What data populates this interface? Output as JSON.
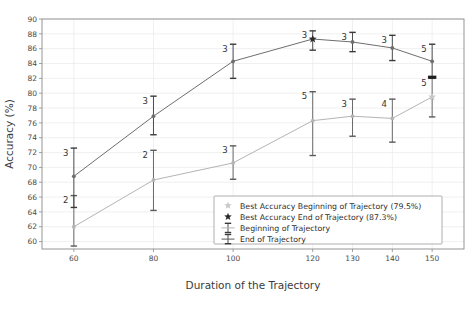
{
  "chart_data": {
    "type": "line",
    "title": "",
    "xlabel": "Duration of the Trajectory",
    "ylabel": "Accuracy (%)",
    "x": [
      60,
      80,
      100,
      120,
      130,
      140,
      150
    ],
    "xtick_labels": [
      "60",
      "80",
      "100",
      "120",
      "130",
      "140",
      "150"
    ],
    "ytick_labels": [
      "60",
      "62",
      "64",
      "66",
      "68",
      "70",
      "72",
      "74",
      "76",
      "78",
      "80",
      "82",
      "84",
      "86",
      "88",
      "90"
    ],
    "ylim": [
      59,
      90
    ],
    "xlim": [
      52,
      158
    ],
    "grid": true,
    "legend_position": "lower right",
    "series": [
      {
        "name": "Beginning of Trajectory",
        "color": "#b4b4b4",
        "values": [
          62.0,
          68.3,
          70.6,
          76.3,
          76.9,
          76.6,
          79.5
        ],
        "err_low": [
          59.4,
          64.2,
          68.4,
          71.6,
          74.2,
          73.4,
          76.8
        ],
        "err_high": [
          66.2,
          72.3,
          72.9,
          80.2,
          79.2,
          79.2,
          82.0
        ],
        "point_labels": [
          "2",
          "2",
          "3",
          "5",
          "3",
          "4",
          "5"
        ],
        "best_value": 79.5,
        "best_x": 150
      },
      {
        "name": "End of Trajectory",
        "color": "#6e6e6e",
        "values": [
          68.8,
          76.9,
          84.3,
          87.3,
          86.9,
          86.1,
          84.3
        ],
        "err_low": [
          64.6,
          74.4,
          82.0,
          85.8,
          85.6,
          84.4,
          82.1
        ],
        "err_high": [
          72.6,
          79.6,
          86.6,
          88.4,
          88.2,
          87.8,
          86.6
        ],
        "point_labels": [
          "3",
          "3",
          "3",
          "3",
          "3",
          "3",
          "5"
        ],
        "best_value": 87.3,
        "best_x": 120
      }
    ],
    "legend_entries": [
      {
        "label": "Best Accuracy Beginning of Trajectory (79.5%)",
        "marker": "star",
        "color": "#c8c8c8"
      },
      {
        "label": "Best Accuracy End of Trajectory (87.3%)",
        "marker": "star",
        "color": "#2b2b2b"
      },
      {
        "label": "Beginning of Trajectory",
        "marker": "errorbar",
        "color": "#b4b4b4"
      },
      {
        "label": "End of Trajectory",
        "marker": "errorbar",
        "color": "#5a5a5a"
      }
    ]
  }
}
